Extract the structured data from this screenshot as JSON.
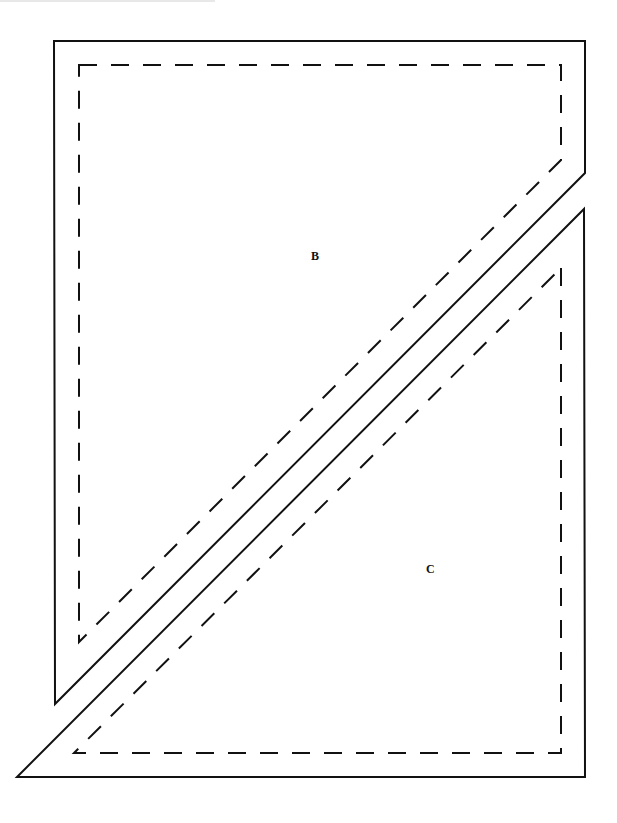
{
  "diagram": {
    "type": "quilt-template",
    "pieces": [
      {
        "id": "B",
        "label": "B",
        "cut_line": [
          [
            54,
            41
          ],
          [
            585,
            41
          ],
          [
            585,
            173
          ],
          [
            55,
            704
          ]
        ],
        "seam_line": [
          [
            79,
            65
          ],
          [
            561,
            65
          ],
          [
            561,
            160
          ],
          [
            79,
            642
          ]
        ]
      },
      {
        "id": "C",
        "label": "C",
        "cut_line": [
          [
            584,
            209
          ],
          [
            585,
            777
          ],
          [
            17,
            777
          ]
        ],
        "seam_line": [
          [
            561,
            268
          ],
          [
            561,
            753
          ],
          [
            74,
            753
          ]
        ]
      }
    ],
    "colors": {
      "line": "#111111",
      "background": "#ffffff"
    }
  }
}
